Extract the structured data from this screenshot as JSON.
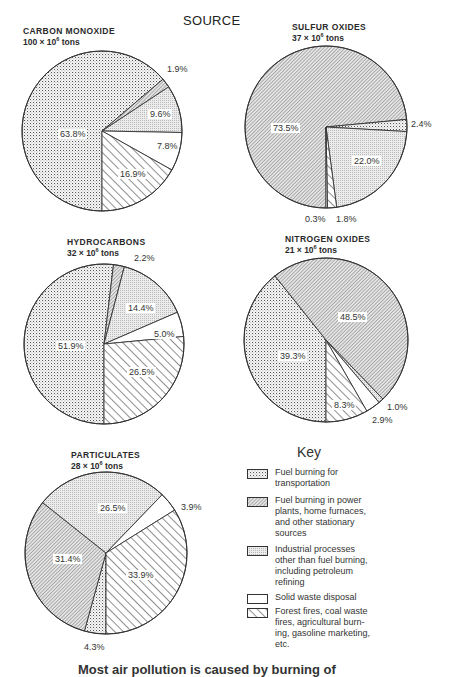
{
  "page": {
    "source_heading": "SOURCE",
    "key_heading": "Key",
    "footer_partial": "Most air pollution is caused by burning of"
  },
  "colors": {
    "ink": "#333333",
    "transport_fill": "#eeeeee",
    "power_fill": "#d9d9d9",
    "industrial_fill": "#e6e6e6",
    "solid_waste_fill": "#ffffff",
    "forest_fill": "#ffffff"
  },
  "legend": [
    {
      "key": "transport",
      "label": "Fuel burning for transportation",
      "lines": [
        "Fuel burning for",
        "transportation"
      ]
    },
    {
      "key": "power",
      "label": "Fuel burning in power plants, home furnaces, and other stationary sources",
      "lines": [
        "Fuel burning in power",
        "plants, home furnaces,",
        "and other stationary",
        "sources"
      ]
    },
    {
      "key": "industrial",
      "label": "Industrial processes other than fuel burning, including petroleum refining",
      "lines": [
        "Industrial processes",
        "other than fuel burning,",
        "including petroleum",
        "refining"
      ]
    },
    {
      "key": "solid_waste",
      "label": "Solid waste disposal",
      "lines": [
        "Solid waste disposal"
      ]
    },
    {
      "key": "forest",
      "label": "Forest fires, coal waste fires, agricultural burning, gasoline marketing, etc.",
      "lines": [
        "Forest fires, coal waste",
        "fires, agricultural burn-",
        "ing, gasoline marketing,",
        "etc."
      ]
    }
  ],
  "charts": [
    {
      "id": "carbon-monoxide",
      "title": "CARBON MONOXIDE",
      "amount": "100",
      "unit_text": "tons",
      "multiplier": "× 10",
      "exponent": "6",
      "title_pos": [
        23,
        26
      ],
      "center": [
        102,
        131
      ],
      "radius": 80,
      "slices": [
        {
          "key": "transport",
          "value": 63.8,
          "label": "63.8%",
          "lx": 60,
          "ly": 137
        },
        {
          "key": "power",
          "value": 1.9,
          "label": "1.9%",
          "lx": 167,
          "ly": 72,
          "callout": true
        },
        {
          "key": "industrial",
          "value": 9.6,
          "label": "9.6%",
          "lx": 150,
          "ly": 117
        },
        {
          "key": "solid_waste",
          "value": 7.8,
          "label": "7.8%",
          "lx": 157,
          "ly": 149
        },
        {
          "key": "forest",
          "value": 16.9,
          "label": "16.9%",
          "lx": 120,
          "ly": 177
        }
      ],
      "order_from_6oclock": [
        "transport",
        "power",
        "industrial",
        "solid_waste",
        "forest"
      ]
    },
    {
      "id": "sulfur-oxides",
      "title": "SULFUR OXIDES",
      "amount": "37",
      "unit_text": "tons",
      "multiplier": "× 10",
      "exponent": "6",
      "title_pos": [
        292,
        22
      ],
      "center": [
        326,
        127
      ],
      "radius": 81,
      "slices": [
        {
          "key": "power",
          "value": 73.5,
          "label": "73.5%",
          "lx": 273,
          "ly": 131
        },
        {
          "key": "transport",
          "value": 2.4,
          "label": "2.4%",
          "lx": 411,
          "ly": 127,
          "callout": true
        },
        {
          "key": "industrial",
          "value": 22.0,
          "label": "22.0%",
          "lx": 354,
          "ly": 164
        },
        {
          "key": "forest",
          "value": 1.8,
          "label": "1.8%",
          "lx": 336,
          "ly": 222,
          "callout": true
        },
        {
          "key": "solid_waste",
          "value": 0.3,
          "label": "0.3%",
          "lx": 305,
          "ly": 222,
          "callout": true
        }
      ],
      "order_from_6oclock": [
        "power",
        "transport",
        "industrial",
        "forest",
        "solid_waste"
      ]
    },
    {
      "id": "hydrocarbons",
      "title": "HYDROCARBONS",
      "amount": "32",
      "unit_text": "tons",
      "multiplier": "× 10",
      "exponent": "6",
      "title_pos": [
        67,
        237
      ],
      "center": [
        104,
        344
      ],
      "radius": 80,
      "slices": [
        {
          "key": "transport",
          "value": 51.9,
          "label": "51.9%",
          "lx": 58,
          "ly": 349
        },
        {
          "key": "power",
          "value": 2.2,
          "label": "2.2%",
          "lx": 134,
          "ly": 261,
          "callout": true
        },
        {
          "key": "industrial",
          "value": 14.4,
          "label": "14.4%",
          "lx": 128,
          "ly": 311
        },
        {
          "key": "solid_waste",
          "value": 5.0,
          "label": "5.0%",
          "lx": 154,
          "ly": 337
        },
        {
          "key": "forest",
          "value": 26.5,
          "label": "26.5%",
          "lx": 129,
          "ly": 375
        }
      ],
      "order_from_6oclock": [
        "transport",
        "power",
        "industrial",
        "solid_waste",
        "forest"
      ]
    },
    {
      "id": "nitrogen-oxides",
      "title": "NITROGEN OXIDES",
      "amount": "21",
      "unit_text": "tons",
      "multiplier": "× 10",
      "exponent": "6",
      "title_pos": [
        285,
        234
      ],
      "center": [
        326,
        340
      ],
      "radius": 82,
      "slices": [
        {
          "key": "transport",
          "value": 39.3,
          "label": "39.3%",
          "lx": 280,
          "ly": 359
        },
        {
          "key": "power",
          "value": 48.5,
          "label": "48.5%",
          "lx": 340,
          "ly": 320
        },
        {
          "key": "industrial",
          "value": 1.0,
          "label": "1.0%",
          "lx": 387,
          "ly": 410,
          "callout": true
        },
        {
          "key": "solid_waste",
          "value": 2.9,
          "label": "2.9%",
          "lx": 372,
          "ly": 423,
          "callout": true
        },
        {
          "key": "forest",
          "value": 8.3,
          "label": "8.3%",
          "lx": 334,
          "ly": 408
        }
      ],
      "order_from_6oclock": [
        "transport",
        "power",
        "industrial",
        "solid_waste",
        "forest"
      ]
    },
    {
      "id": "particulates",
      "title": "PARTICULATES",
      "amount": "28",
      "unit_text": "tons",
      "multiplier": "× 10",
      "exponent": "6",
      "title_pos": [
        71,
        450
      ],
      "center": [
        106,
        553
      ],
      "radius": 81,
      "slices": [
        {
          "key": "transport",
          "value": 4.3,
          "label": "4.3%",
          "lx": 84,
          "ly": 650,
          "callout": true
        },
        {
          "key": "power",
          "value": 31.4,
          "label": "31.4%",
          "lx": 55,
          "ly": 562
        },
        {
          "key": "industrial",
          "value": 26.5,
          "label": "26.5%",
          "lx": 100,
          "ly": 511
        },
        {
          "key": "solid_waste",
          "value": 3.9,
          "label": "3.9%",
          "lx": 181,
          "ly": 510,
          "callout": true
        },
        {
          "key": "forest",
          "value": 33.9,
          "label": "33.9%",
          "lx": 128,
          "ly": 578
        }
      ],
      "order_from_6oclock": [
        "transport",
        "power",
        "industrial",
        "solid_waste",
        "forest"
      ]
    }
  ],
  "chart_data": [
    {
      "type": "pie",
      "title": "CARBON MONOXIDE 100 × 10^6 tons",
      "categories": [
        "Fuel burning for transportation",
        "Fuel burning in power plants, home furnaces, and other stationary sources",
        "Industrial processes other than fuel burning, including petroleum refining",
        "Solid waste disposal",
        "Forest fires, coal waste fires, agricultural burning, gasoline marketing, etc."
      ],
      "values": [
        63.8,
        1.9,
        9.6,
        7.8,
        16.9
      ],
      "unit": "%"
    },
    {
      "type": "pie",
      "title": "SULFUR OXIDES 37 × 10^6 tons",
      "categories": [
        "Fuel burning for transportation",
        "Fuel burning in power plants, home furnaces, and other stationary sources",
        "Industrial processes other than fuel burning, including petroleum refining",
        "Solid waste disposal",
        "Forest fires, coal waste fires, agricultural burning, gasoline marketing, etc."
      ],
      "values": [
        2.4,
        73.5,
        22.0,
        0.3,
        1.8
      ],
      "unit": "%"
    },
    {
      "type": "pie",
      "title": "HYDROCARBONS 32 × 10^6 tons",
      "categories": [
        "Fuel burning for transportation",
        "Fuel burning in power plants, home furnaces, and other stationary sources",
        "Industrial processes other than fuel burning, including petroleum refining",
        "Solid waste disposal",
        "Forest fires, coal waste fires, agricultural burning, gasoline marketing, etc."
      ],
      "values": [
        51.9,
        2.2,
        14.4,
        5.0,
        26.5
      ],
      "unit": "%"
    },
    {
      "type": "pie",
      "title": "NITROGEN OXIDES 21 × 10^6 tons",
      "categories": [
        "Fuel burning for transportation",
        "Fuel burning in power plants, home furnaces, and other stationary sources",
        "Industrial processes other than fuel burning, including petroleum refining",
        "Solid waste disposal",
        "Forest fires, coal waste fires, agricultural burning, gasoline marketing, etc."
      ],
      "values": [
        39.3,
        48.5,
        1.0,
        2.9,
        8.3
      ],
      "unit": "%"
    },
    {
      "type": "pie",
      "title": "PARTICULATES 28 × 10^6 tons",
      "categories": [
        "Fuel burning for transportation",
        "Fuel burning in power plants, home furnaces, and other stationary sources",
        "Industrial processes other than fuel burning, including petroleum refining",
        "Solid waste disposal",
        "Forest fires, coal waste fires, agricultural burning, gasoline marketing, etc."
      ],
      "values": [
        4.3,
        31.4,
        26.5,
        3.9,
        33.9
      ],
      "unit": "%"
    }
  ]
}
